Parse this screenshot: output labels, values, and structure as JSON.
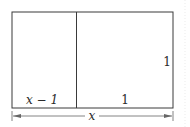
{
  "diagram": {
    "left_width_label": "x − 1",
    "right_width_label": "1",
    "height_label": "1",
    "total_width_label": "x",
    "line_color": "#3a3a3a",
    "dim_color": "#666666"
  }
}
